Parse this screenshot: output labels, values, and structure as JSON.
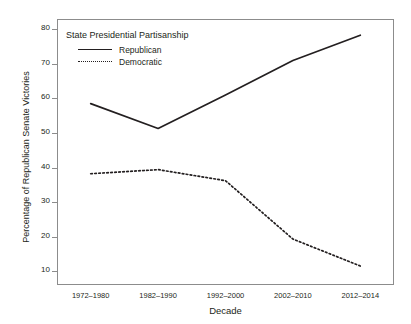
{
  "chart_data": {
    "type": "line",
    "title": "",
    "xlabel": "Decade",
    "ylabel": "Percentage of Republican Senate Victories",
    "categories": [
      "1972–1980",
      "1982–1990",
      "1992–2000",
      "2002–2010",
      "2012–2014"
    ],
    "series": [
      {
        "name": "Republican",
        "style": "solid",
        "values": [
          58.5,
          51.3,
          61.0,
          71.0,
          78.3
        ]
      },
      {
        "name": "Democratic",
        "style": "dotted",
        "values": [
          38.2,
          39.4,
          36.2,
          19.3,
          11.5
        ]
      }
    ],
    "ylim": [
      6,
      83
    ],
    "yticks": [
      10,
      20,
      30,
      40,
      50,
      60,
      70,
      80
    ],
    "ytick_labels": [
      "10",
      "20",
      "30",
      "40",
      "50",
      "60",
      "70",
      "80"
    ],
    "grid": false,
    "legend_position": "top-left",
    "legend_title": "State Presidential Partisanship",
    "line_color": "#231f20",
    "frame_color": "#8c8c8c",
    "background": "#ffffff"
  }
}
